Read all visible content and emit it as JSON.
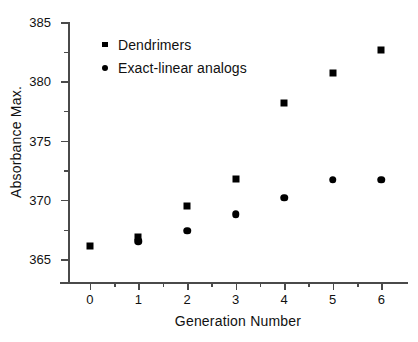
{
  "chart_data": {
    "type": "scatter",
    "title": "",
    "xlabel": "Generation Number",
    "ylabel": "Absorbance Max.",
    "x": [
      0,
      1,
      2,
      3,
      4,
      5,
      6
    ],
    "xlim": [
      -0.45,
      6.55
    ],
    "ylim": [
      363.0,
      385.0
    ],
    "grid": false,
    "legend_position": "upper-left-inside",
    "x_ticks": [
      "0",
      "1",
      "2",
      "3",
      "4",
      "5",
      "6"
    ],
    "x_tick_values": [
      0,
      1,
      2,
      3,
      4,
      5,
      6
    ],
    "x_minor_tick_values": [
      0.5,
      1.5,
      2.5,
      3.5,
      4.5,
      5.5
    ],
    "y_ticks": [
      "385",
      "380",
      "375",
      "370",
      "365"
    ],
    "y_tick_values": [
      385,
      380,
      375,
      370,
      365
    ],
    "y_minor_tick_values": [
      382.5,
      377.5,
      372.5,
      367.5
    ],
    "series": [
      {
        "name": "Dendrimers",
        "marker": "square",
        "color": "#000000",
        "x": [
          0,
          1,
          2,
          3,
          4,
          5,
          6
        ],
        "values": [
          366.1,
          366.9,
          369.5,
          371.8,
          378.2,
          380.7,
          382.6
        ]
      },
      {
        "name": "Exact-linear analogs",
        "marker": "circle",
        "color": "#000000",
        "x": [
          1,
          2,
          3,
          4,
          5,
          6
        ],
        "values": [
          366.5,
          367.4,
          368.8,
          370.2,
          371.7,
          371.7
        ]
      }
    ]
  },
  "legend": {
    "items": [
      {
        "label": "Dendrimers",
        "marker": "square"
      },
      {
        "label": "Exact-linear analogs",
        "marker": "circle"
      }
    ]
  }
}
